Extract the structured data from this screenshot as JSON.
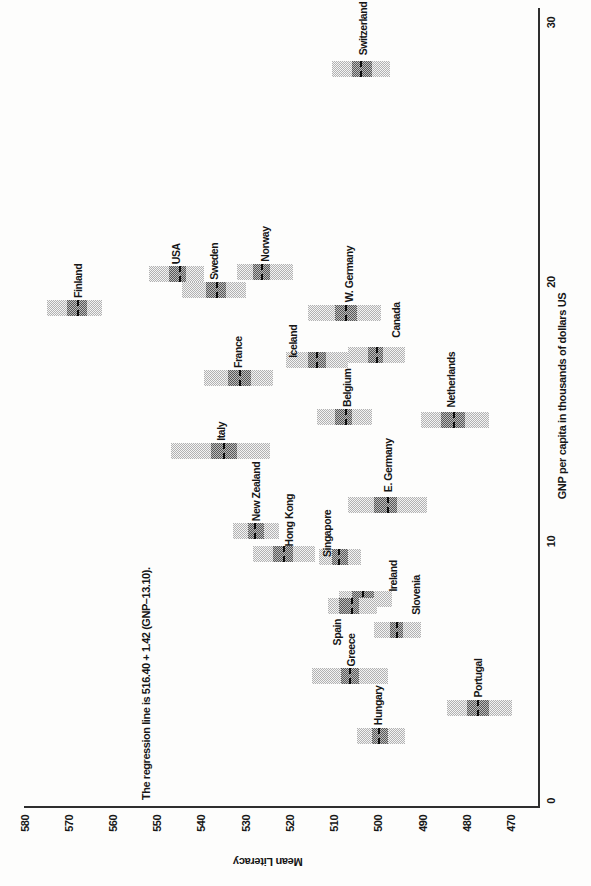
{
  "figure": {
    "regression_note": "The regression line is 516.40 + 1.42 (GNP–13.10).",
    "x_axis_title": "GNP per capita in thousands of dollars US",
    "y_axis_title": "Mean Literacy"
  },
  "colors": {
    "outer_box_fill": "#b2b2b2",
    "inner_box_fill": "#565656",
    "mean_line": "#0d0d0d",
    "axis": "#2e2e2e",
    "text": "#161616",
    "background": "#fdfdfc"
  },
  "chart_data": {
    "type": "bar",
    "variant": "country means with nested confidence-interval boxes and dashed mean line",
    "title": "",
    "xlabel": "GNP per capita in thousands of dollars US",
    "ylabel": "Mean Literacy",
    "xlim": [
      0,
      30
    ],
    "ylim": [
      470,
      580
    ],
    "x_ticks": [
      0,
      10,
      20,
      30
    ],
    "y_ticks": [
      580,
      570,
      560,
      550,
      540,
      530,
      520,
      510,
      500,
      490,
      480,
      470
    ],
    "annotation": "The regression line is 516.40 + 1.42 (GNP–13.10).",
    "orientation_note": "figure printed rotated 90 degrees counterclockwise on portrait page",
    "grid": false,
    "points": [
      {
        "country": "Finland",
        "gnp": 19.0,
        "mean": 568.0,
        "outer": [
          562.5,
          575.0
        ],
        "inner": [
          566.0,
          570.5
        ],
        "label_offset": [
          0,
          3
        ]
      },
      {
        "country": "USA",
        "gnp": 20.3,
        "mean": 545.0,
        "outer": [
          539.5,
          552.0
        ],
        "inner": [
          543.5,
          547.5
        ],
        "label_offset": [
          0,
          0
        ]
      },
      {
        "country": "Sweden",
        "gnp": 19.7,
        "mean": 536.5,
        "outer": [
          530.0,
          544.5
        ],
        "inner": [
          534.5,
          539.0
        ],
        "label_offset": [
          0,
          0
        ]
      },
      {
        "country": "Norway",
        "gnp": 20.4,
        "mean": 526.5,
        "outer": [
          519.5,
          532.0
        ],
        "inner": [
          524.5,
          528.5
        ],
        "label_offset": [
          0,
          0
        ]
      },
      {
        "country": "Switzerland",
        "gnp": 28.2,
        "mean": 504.0,
        "outer": [
          497.5,
          510.5
        ],
        "inner": [
          501.5,
          506.0
        ],
        "label_offset": [
          4,
          2
        ]
      },
      {
        "country": "W. Germany",
        "gnp": 18.8,
        "mean": 507.5,
        "outer": [
          499.5,
          516.0
        ],
        "inner": [
          505.0,
          510.0
        ],
        "label_offset": [
          1,
          4
        ]
      },
      {
        "country": "Canada",
        "gnp": 17.2,
        "mean": 500.5,
        "outer": [
          494.0,
          507.0
        ],
        "inner": [
          499.0,
          502.5
        ],
        "label_offset": [
          7,
          19
        ]
      },
      {
        "country": "Iceland",
        "gnp": 17.0,
        "mean": 514.0,
        "outer": [
          507.0,
          521.0
        ],
        "inner": [
          512.0,
          516.0
        ],
        "label_offset": [
          -8,
          -24
        ]
      },
      {
        "country": "France",
        "gnp": 16.3,
        "mean": 531.5,
        "outer": [
          524.0,
          539.5
        ],
        "inner": [
          529.0,
          534.0
        ],
        "label_offset": [
          0,
          0
        ]
      },
      {
        "country": "Belgium",
        "gnp": 14.8,
        "mean": 507.5,
        "outer": [
          501.5,
          514.0
        ],
        "inner": [
          506.0,
          510.0
        ],
        "label_offset": [
          0,
          2
        ]
      },
      {
        "country": "Netherlands",
        "gnp": 14.7,
        "mean": 483.0,
        "outer": [
          475.0,
          490.5
        ],
        "inner": [
          480.5,
          486.0
        ],
        "label_offset": [
          2,
          -4
        ]
      },
      {
        "country": "Italy",
        "gnp": 13.5,
        "mean": 535.0,
        "outer": [
          524.5,
          547.0
        ],
        "inner": [
          532.0,
          538.0
        ],
        "label_offset": [
          0,
          0
        ]
      },
      {
        "country": "E. Germany",
        "gnp": 11.4,
        "mean": 498.0,
        "outer": [
          489.0,
          507.0
        ],
        "inner": [
          496.0,
          501.0
        ],
        "label_offset": [
          3,
          0
        ]
      },
      {
        "country": "New Zealand",
        "gnp": 10.4,
        "mean": 528.0,
        "outer": [
          522.5,
          533.0
        ],
        "inner": [
          526.0,
          529.5
        ],
        "label_offset": [
          0,
          0
        ]
      },
      {
        "country": "Hong Kong",
        "gnp": 9.5,
        "mean": 521.5,
        "outer": [
          514.5,
          528.5
        ],
        "inner": [
          519.5,
          524.0
        ],
        "label_offset": [
          -2,
          5
        ]
      },
      {
        "country": "Singapore",
        "gnp": 9.4,
        "mean": 509.0,
        "outer": [
          504.0,
          513.5
        ],
        "inner": [
          507.0,
          510.5
        ],
        "label_offset": [
          -10,
          -13
        ]
      },
      {
        "country": "Ireland",
        "gnp": 7.8,
        "mean": 503.5,
        "outer": [
          497.0,
          509.0
        ],
        "inner": [
          501.0,
          506.0
        ],
        "label_offset": [
          -3,
          27
        ]
      },
      {
        "country": "Spain",
        "gnp": 7.5,
        "mean": 506.0,
        "outer": [
          500.5,
          511.5
        ],
        "inner": [
          504.5,
          509.0
        ],
        "label_offset": [
          -49,
          -15
        ]
      },
      {
        "country": "Slovenia",
        "gnp": 6.6,
        "mean": 496.0,
        "outer": [
          490.5,
          501.0
        ],
        "inner": [
          494.5,
          497.5
        ],
        "label_offset": [
          5,
          18
        ]
      },
      {
        "country": "Greece",
        "gnp": 4.8,
        "mean": 506.5,
        "outer": [
          498.0,
          515.0
        ],
        "inner": [
          504.5,
          508.5
        ],
        "label_offset": [
          0,
          1
        ]
      },
      {
        "country": "Portugal",
        "gnp": 3.6,
        "mean": 477.5,
        "outer": [
          470.0,
          484.5
        ],
        "inner": [
          475.0,
          480.0
        ],
        "label_offset": [
          0,
          -1
        ]
      },
      {
        "country": "Hungary",
        "gnp": 2.5,
        "mean": 500.0,
        "outer": [
          494.0,
          505.0
        ],
        "inner": [
          498.0,
          501.5
        ],
        "label_offset": [
          1,
          -3
        ]
      }
    ]
  }
}
